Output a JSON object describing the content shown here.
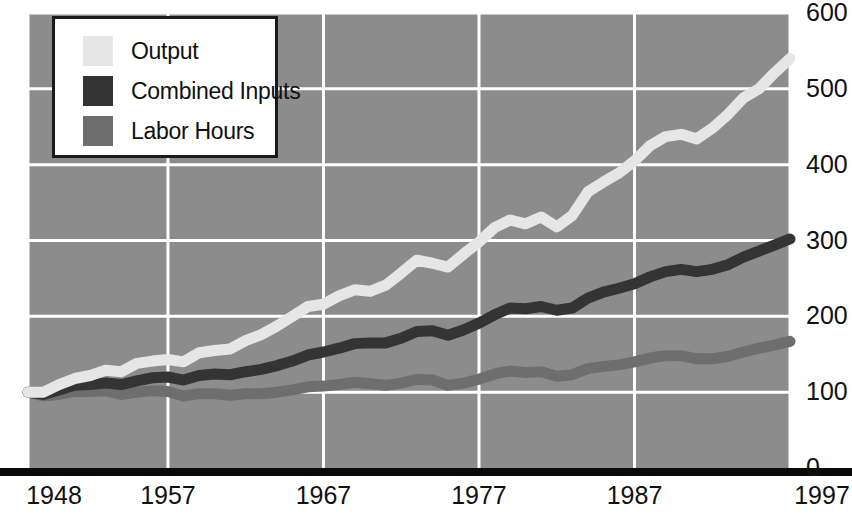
{
  "chart_data": {
    "type": "line",
    "title": "",
    "subtitle": "",
    "xlabel": "",
    "ylabel": "",
    "xlim": [
      1948,
      1997
    ],
    "ylim": [
      0,
      600
    ],
    "grid": true,
    "legend_position": "top-left",
    "y_ticks": [
      "600",
      "500",
      "400",
      "300",
      "200",
      "100",
      "0"
    ],
    "y_tick_values": [
      600,
      500,
      400,
      300,
      200,
      100,
      0
    ],
    "x_ticks": [
      "1948",
      "1957",
      "1967",
      "1977",
      "1987",
      "1997"
    ],
    "x_tick_values": [
      1948,
      1957,
      1967,
      1977,
      1987,
      1997
    ],
    "x": [
      1948,
      1949,
      1950,
      1951,
      1952,
      1953,
      1954,
      1955,
      1956,
      1957,
      1958,
      1959,
      1960,
      1961,
      1962,
      1963,
      1964,
      1965,
      1966,
      1967,
      1968,
      1969,
      1970,
      1971,
      1972,
      1973,
      1974,
      1975,
      1976,
      1977,
      1978,
      1979,
      1980,
      1981,
      1982,
      1983,
      1984,
      1985,
      1986,
      1987,
      1988,
      1989,
      1990,
      1991,
      1992,
      1993,
      1994,
      1995,
      1996,
      1997
    ],
    "series": [
      {
        "name": "Output",
        "color": "#e6e6e6",
        "values": [
          100,
          100,
          110,
          118,
          122,
          129,
          127,
          138,
          141,
          143,
          140,
          152,
          155,
          157,
          168,
          176,
          187,
          200,
          213,
          216,
          227,
          235,
          233,
          241,
          257,
          274,
          270,
          265,
          282,
          298,
          317,
          327,
          322,
          331,
          318,
          333,
          364,
          377,
          389,
          405,
          425,
          437,
          440,
          434,
          448,
          466,
          488,
          500,
          521,
          540
        ]
      },
      {
        "name": "Combined Inputs",
        "color": "#343434",
        "values": [
          100,
          97,
          103,
          109,
          110,
          112,
          110,
          115,
          119,
          120,
          116,
          122,
          124,
          123,
          127,
          130,
          135,
          141,
          149,
          153,
          158,
          164,
          165,
          165,
          171,
          180,
          181,
          175,
          182,
          191,
          202,
          211,
          210,
          213,
          208,
          211,
          224,
          232,
          237,
          243,
          252,
          259,
          262,
          259,
          262,
          268,
          278,
          286,
          294,
          302
        ]
      },
      {
        "name": "Labor Hours",
        "color": "#6e6e6e",
        "values": [
          100,
          95,
          97,
          101,
          101,
          102,
          97,
          100,
          102,
          101,
          95,
          98,
          98,
          96,
          98,
          98,
          100,
          103,
          107,
          108,
          110,
          113,
          111,
          109,
          112,
          117,
          116,
          109,
          112,
          117,
          124,
          128,
          126,
          127,
          121,
          123,
          131,
          134,
          136,
          140,
          145,
          148,
          148,
          144,
          144,
          147,
          153,
          158,
          162,
          167
        ]
      }
    ]
  },
  "legend": {
    "items": [
      {
        "label": "Output",
        "color": "#e6e6e6"
      },
      {
        "label": "Combined Inputs",
        "color": "#343434"
      },
      {
        "label": "Labor Hours",
        "color": "#6e6e6e"
      }
    ]
  },
  "style": {
    "plot_background": "#8c8c8c",
    "gridline_color": "#ffffff",
    "baseline_color": "#0a0a0a",
    "text_color": "#111111",
    "page_background": "#ffffff"
  }
}
